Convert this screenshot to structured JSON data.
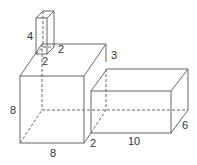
{
  "diagram": {
    "colors": {
      "line": "#666666",
      "text": "#333333",
      "background": "#ffffff"
    },
    "small_box": {
      "height": "4",
      "width": "2",
      "depth": "2"
    },
    "cube": {
      "height": "8",
      "width": "8",
      "depth": "3"
    },
    "right_box": {
      "length": "10",
      "height": "6",
      "gap": "2"
    }
  }
}
